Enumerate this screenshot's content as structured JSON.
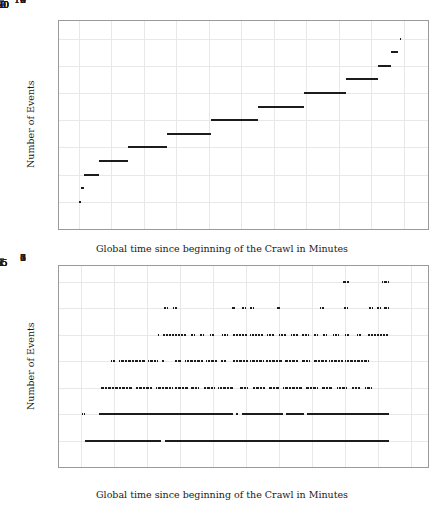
{
  "chart_data": [
    {
      "id": "top",
      "type": "scatter",
      "title": "",
      "xlabel": "Global time since beginning of the Crawl in Minutes",
      "ylabel": "Number of Events",
      "xlim": [
        -12,
        215
      ],
      "ylim": [
        0,
        15.3
      ],
      "xticks": [
        0,
        20,
        40,
        60,
        80,
        100,
        120,
        140,
        160,
        180,
        200
      ],
      "xticklabels": [
        "0",
        "20",
        "40",
        "60",
        "80",
        "100",
        "120",
        "140",
        "160",
        "180",
        "200"
      ],
      "yticks": [
        0,
        2,
        4,
        6,
        8,
        10,
        12,
        14
      ],
      "yticklabels": [
        "0",
        "2",
        "4",
        "6",
        "8",
        "10",
        "12",
        "14"
      ],
      "grid": true,
      "legend": null,
      "marker_color": "#1c1c1c",
      "description": "Monotone step function: cumulative number of events versus global crawl time. Each integer event count occupies a horizontal run of time.",
      "segments": [
        {
          "y": 2,
          "x0": 0.2,
          "x1": 1.5
        },
        {
          "y": 3,
          "x0": 1.5,
          "x1": 3.2
        },
        {
          "y": 4,
          "x0": 3.2,
          "x1": 12.5
        },
        {
          "y": 5,
          "x0": 12.5,
          "x1": 30.5
        },
        {
          "y": 6,
          "x0": 30.5,
          "x1": 54.5
        },
        {
          "y": 7,
          "x0": 54.5,
          "x1": 81.5
        },
        {
          "y": 8,
          "x0": 81.5,
          "x1": 110.5
        },
        {
          "y": 9,
          "x0": 110.5,
          "x1": 138.5
        },
        {
          "y": 10,
          "x0": 138.5,
          "x1": 164.5
        },
        {
          "y": 11,
          "x0": 164.5,
          "x1": 184.0
        },
        {
          "y": 12,
          "x0": 184.0,
          "x1": 192.5
        },
        {
          "y": 13,
          "x0": 192.5,
          "x1": 196.5
        },
        {
          "y": 14,
          "x0": 197.5,
          "x1": 198.5
        }
      ]
    },
    {
      "id": "bottom",
      "type": "scatter",
      "title": "",
      "xlabel": "Global time since beginning of the Crawl in Minutes",
      "ylabel": "Number of Events",
      "xlim": [
        -0.33,
        5.25
      ],
      "ylim": [
        0,
        7.6
      ],
      "xticks": [
        0,
        0.5,
        1,
        1.5,
        2,
        2.5,
        3,
        3.5,
        4,
        4.5,
        5
      ],
      "xticklabels": [
        "0",
        "0.5",
        "1",
        "1.5",
        "2",
        "2.5",
        "3",
        "3.5",
        "4",
        "4.5",
        "5"
      ],
      "yticks": [
        0,
        1,
        2,
        3,
        4,
        5,
        6,
        7
      ],
      "yticklabels": [
        "0",
        "1",
        "2",
        "3",
        "4",
        "5",
        "6",
        "7"
      ],
      "grid": true,
      "legend": null,
      "marker_color": "#1c1c1c",
      "description": "Dense dotted horizontal bands of concurrent event counts versus global crawl time; level 1 and 2 are near-continuous, higher levels increasingly sparse.",
      "bands": [
        {
          "y": 1,
          "runs": [
            [
              0.06,
              1.22
            ],
            [
              1.27,
              4.66
            ]
          ]
        },
        {
          "y": 2,
          "runs": [
            [
              0.02,
              0.05
            ],
            [
              0.28,
              2.3
            ],
            [
              2.34,
              2.38
            ],
            [
              2.43,
              3.06
            ],
            [
              3.1,
              3.38
            ],
            [
              3.42,
              4.66
            ]
          ]
        },
        {
          "y": 3,
          "runs": [
            [
              0.3,
              0.78
            ],
            [
              0.83,
              1.08
            ],
            [
              1.14,
              1.38
            ],
            [
              1.42,
              1.62
            ],
            [
              1.66,
              1.78
            ],
            [
              1.86,
              2.02
            ],
            [
              2.08,
              2.3
            ],
            [
              2.4,
              2.52
            ],
            [
              2.6,
              2.78
            ],
            [
              2.84,
              3.0
            ],
            [
              3.06,
              3.34
            ],
            [
              3.4,
              3.58
            ],
            [
              3.64,
              3.8
            ],
            [
              3.88,
              4.02
            ],
            [
              4.1,
              4.22
            ],
            [
              4.3,
              4.4
            ]
          ]
        },
        {
          "y": 4,
          "runs": [
            [
              0.46,
              0.52
            ],
            [
              0.58,
              0.98
            ],
            [
              1.02,
              1.16
            ],
            [
              1.22,
              1.26
            ],
            [
              1.42,
              1.52
            ],
            [
              1.58,
              1.84
            ],
            [
              1.9,
              2.06
            ],
            [
              2.12,
              2.2
            ],
            [
              2.3,
              2.52
            ],
            [
              2.56,
              2.76
            ],
            [
              2.8,
              3.04
            ],
            [
              3.08,
              3.28
            ],
            [
              3.34,
              3.46
            ],
            [
              3.52,
              3.72
            ],
            [
              3.76,
              3.96
            ],
            [
              4.0,
              4.34
            ]
          ]
        },
        {
          "y": 5,
          "runs": [
            [
              1.16,
              1.18
            ],
            [
              1.24,
              1.6
            ],
            [
              1.66,
              1.72
            ],
            [
              1.8,
              1.86
            ],
            [
              1.96,
              2.02
            ],
            [
              2.14,
              2.22
            ],
            [
              2.3,
              2.52
            ],
            [
              2.56,
              2.76
            ],
            [
              2.82,
              2.92
            ],
            [
              3.0,
              3.1
            ],
            [
              3.18,
              3.28
            ],
            [
              3.34,
              3.44
            ],
            [
              3.52,
              3.58
            ],
            [
              3.66,
              3.72
            ],
            [
              3.82,
              3.9
            ],
            [
              4.0,
              4.06
            ],
            [
              4.18,
              4.24
            ],
            [
              4.34,
              4.64
            ]
          ]
        },
        {
          "y": 6,
          "runs": [
            [
              1.26,
              1.3
            ],
            [
              1.4,
              1.44
            ],
            [
              2.28,
              2.32
            ],
            [
              2.44,
              2.48
            ],
            [
              2.56,
              2.6
            ],
            [
              2.96,
              3.0
            ],
            [
              3.62,
              3.66
            ],
            [
              3.98,
              4.02
            ],
            [
              4.36,
              4.4
            ],
            [
              4.48,
              4.52
            ],
            [
              4.58,
              4.64
            ]
          ]
        },
        {
          "y": 7,
          "runs": [
            [
              3.96,
              4.04
            ],
            [
              4.56,
              4.64
            ]
          ]
        }
      ]
    }
  ]
}
